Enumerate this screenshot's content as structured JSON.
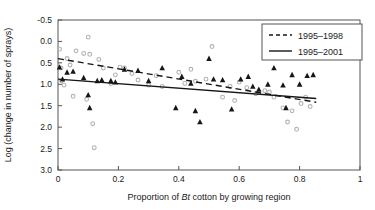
{
  "chart_data": {
    "type": "scatter",
    "title": "",
    "xlabel": "Proportion of Bt cotton by growing region",
    "xlabel_parts": {
      "pre": "Proportion of ",
      "italic": "Bt",
      "post": " cotton by growing region"
    },
    "ylabel": "Log (change in number of sprays)",
    "xlim": [
      0,
      1
    ],
    "ylim": [
      -0.5,
      3.0
    ],
    "y_inverted": true,
    "grid": false,
    "xticks": [
      0,
      0.2,
      0.4,
      0.6,
      0.8,
      1
    ],
    "xtick_labels": [
      "0",
      "0.2",
      "0.4",
      "0.6",
      "0.8",
      "1"
    ],
    "yticks": [
      -0.5,
      0.0,
      0.5,
      1.0,
      1.5,
      2.0,
      2.5,
      3.0
    ],
    "ytick_labels": [
      "-0.5",
      "0.0",
      "0.5",
      "1.0",
      "1.5",
      "2.0",
      "2.5",
      "3.0"
    ],
    "legend_position": "top-right",
    "series": [
      {
        "name": "1995-1998",
        "marker": "circle",
        "color": "#b3b3b3",
        "points": [
          [
            0.005,
            0.18
          ],
          [
            0.01,
            0.62
          ],
          [
            0.012,
            0.92
          ],
          [
            0.02,
            1.02
          ],
          [
            0.03,
            0.4
          ],
          [
            0.04,
            0.55
          ],
          [
            0.05,
            1.28
          ],
          [
            0.06,
            0.22
          ],
          [
            0.085,
            0.28
          ],
          [
            0.095,
            1.35
          ],
          [
            0.1,
            -0.1
          ],
          [
            0.105,
            0.3
          ],
          [
            0.115,
            1.92
          ],
          [
            0.12,
            2.48
          ],
          [
            0.135,
            0.42
          ],
          [
            0.15,
            0.62
          ],
          [
            0.175,
            0.98
          ],
          [
            0.19,
            0.78
          ],
          [
            0.205,
            0.6
          ],
          [
            0.22,
            0.62
          ],
          [
            0.245,
            0.75
          ],
          [
            0.265,
            0.9
          ],
          [
            0.3,
            1.02
          ],
          [
            0.325,
            0.8
          ],
          [
            0.345,
            1.05
          ],
          [
            0.4,
            0.72
          ],
          [
            0.42,
            0.98
          ],
          [
            0.44,
            0.65
          ],
          [
            0.455,
            0.93
          ],
          [
            0.49,
            0.88
          ],
          [
            0.51,
            0.12
          ],
          [
            0.545,
            1.3
          ],
          [
            0.57,
            1.05
          ],
          [
            0.585,
            1.38
          ],
          [
            0.6,
            0.95
          ],
          [
            0.625,
            1.08
          ],
          [
            0.655,
            1.22
          ],
          [
            0.685,
            1.15
          ],
          [
            0.7,
            1.18
          ],
          [
            0.715,
            1.3
          ],
          [
            0.745,
            1.55
          ],
          [
            0.76,
            1.88
          ],
          [
            0.775,
            1.62
          ],
          [
            0.79,
            2.05
          ],
          [
            0.805,
            1.45
          ],
          [
            0.82,
            1.3
          ],
          [
            0.835,
            1.52
          ]
        ]
      },
      {
        "name": "1995-2001",
        "marker": "triangle",
        "color": "#161616",
        "points": [
          [
            0.005,
            0.6
          ],
          [
            0.015,
            0.88
          ],
          [
            0.03,
            0.72
          ],
          [
            0.05,
            0.7
          ],
          [
            0.085,
            0.85
          ],
          [
            0.1,
            1.25
          ],
          [
            0.105,
            1.55
          ],
          [
            0.13,
            0.92
          ],
          [
            0.145,
            0.9
          ],
          [
            0.175,
            0.92
          ],
          [
            0.19,
            0.95
          ],
          [
            0.22,
            0.65
          ],
          [
            0.265,
            0.68
          ],
          [
            0.3,
            0.92
          ],
          [
            0.345,
            0.62
          ],
          [
            0.39,
            1.55
          ],
          [
            0.41,
            0.82
          ],
          [
            0.44,
            0.98
          ],
          [
            0.455,
            1.62
          ],
          [
            0.47,
            1.88
          ],
          [
            0.5,
            0.4
          ],
          [
            0.515,
            0.88
          ],
          [
            0.545,
            0.9
          ],
          [
            0.575,
            1.58
          ],
          [
            0.605,
            0.88
          ],
          [
            0.63,
            0.82
          ],
          [
            0.645,
            1.05
          ],
          [
            0.665,
            1.12
          ],
          [
            0.695,
            1.0
          ],
          [
            0.715,
            0.62
          ],
          [
            0.745,
            1.02
          ],
          [
            0.755,
            1.55
          ],
          [
            0.775,
            0.78
          ],
          [
            0.8,
            1.0
          ],
          [
            0.825,
            0.8
          ],
          [
            0.845,
            0.78
          ]
        ]
      }
    ],
    "trend_lines": [
      {
        "name": "1995-1998",
        "style": "dashed",
        "color": "#161616",
        "x0": 0.0,
        "y0": 0.4,
        "x1": 0.855,
        "y1": 1.42
      },
      {
        "name": "1995-2001",
        "style": "solid",
        "color": "#161616",
        "x0": 0.0,
        "y0": 0.88,
        "x1": 0.855,
        "y1": 1.33
      }
    ],
    "legend": [
      {
        "label": "1995–1998",
        "style": "dashed"
      },
      {
        "label": "1995–2001",
        "style": "solid"
      }
    ]
  }
}
